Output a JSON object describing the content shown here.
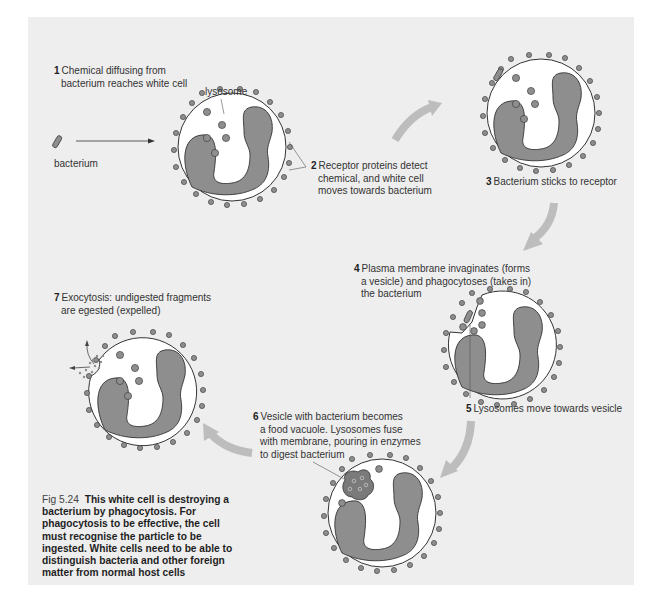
{
  "figure": {
    "number": "Fig 5.24",
    "caption": "This white cell is destroying a bacterium by phagocytosis. For phagocytosis to be effective, the cell must recognise the particle to be ingested. White cells need to be able to distinguish bacteria and other foreign matter from normal host cells",
    "background_color": "#eeeeee",
    "cell_fill": "#ffffff",
    "nucleus_fill": "#8c8c8c",
    "granule_fill": "#8c8c8c",
    "arrow_color": "#bdbdbd"
  },
  "labels": {
    "bacterium": "bacterium",
    "lysosome": "lysosome"
  },
  "steps": [
    {
      "number": "1",
      "line1": "Chemical diffusing from",
      "line2": "bacterium reaches white cell",
      "line3": ""
    },
    {
      "number": "2",
      "line1": "Receptor proteins detect",
      "line2": "chemical, and white cell",
      "line3": "moves towards bacterium"
    },
    {
      "number": "3",
      "line1": "Bacterium sticks to receptor",
      "line2": "",
      "line3": ""
    },
    {
      "number": "4",
      "line1": "Plasma membrane invaginates (forms",
      "line2": "a vesicle) and phagocytoses (takes in)",
      "line3": "the bacterium"
    },
    {
      "number": "5",
      "line1": "Lysosomes move towards vesicle",
      "line2": "",
      "line3": ""
    },
    {
      "number": "6",
      "line1": "Vesicle with bacterium becomes",
      "line2": "a food vacuole.  Lysosomes fuse",
      "line3": "with membrane, pouring in enzymes",
      "line4": "to digest bacterium"
    },
    {
      "number": "7",
      "line1": "Exocytosis: undigested fragments",
      "line2": "are egested (expelled)",
      "line3": ""
    }
  ]
}
